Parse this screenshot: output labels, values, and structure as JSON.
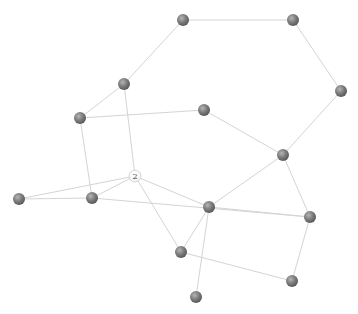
{
  "graph": {
    "node_radius": 6,
    "colors": {
      "edge": "#d4d4d4",
      "node_dark_light": "#b5b5b5",
      "node_dark_mid": "#7d7d7d",
      "node_dark_shadow": "#5a5a5a",
      "node_light_fill": "#ffffff",
      "node_light_stroke": "#bdbdbd"
    },
    "nodes": [
      {
        "id": "A",
        "label": "",
        "x": 183,
        "y": 20,
        "style": "dark"
      },
      {
        "id": "B",
        "label": "",
        "x": 293,
        "y": 20,
        "style": "dark"
      },
      {
        "id": "C",
        "label": "",
        "x": 341,
        "y": 91,
        "style": "dark"
      },
      {
        "id": "D",
        "label": "",
        "x": 283,
        "y": 155,
        "style": "dark"
      },
      {
        "id": "E",
        "label": "",
        "x": 124,
        "y": 84,
        "style": "dark"
      },
      {
        "id": "F",
        "label": "",
        "x": 80,
        "y": 118,
        "style": "dark"
      },
      {
        "id": "G",
        "label": "",
        "x": 204,
        "y": 110,
        "style": "dark"
      },
      {
        "id": "N2",
        "label": "2",
        "x": 135,
        "y": 176,
        "style": "light"
      },
      {
        "id": "K",
        "label": "",
        "x": 19,
        "y": 199,
        "style": "dark"
      },
      {
        "id": "H",
        "label": "",
        "x": 92,
        "y": 198,
        "style": "dark"
      },
      {
        "id": "I",
        "label": "",
        "x": 209,
        "y": 207,
        "style": "dark"
      },
      {
        "id": "J",
        "label": "",
        "x": 310,
        "y": 217,
        "style": "dark"
      },
      {
        "id": "L",
        "label": "",
        "x": 181,
        "y": 252,
        "style": "dark"
      },
      {
        "id": "N",
        "label": "",
        "x": 292,
        "y": 281,
        "style": "dark"
      },
      {
        "id": "M",
        "label": "",
        "x": 196,
        "y": 297,
        "style": "dark"
      }
    ],
    "edges": [
      [
        "A",
        "B"
      ],
      [
        "B",
        "C"
      ],
      [
        "C",
        "D"
      ],
      [
        "E",
        "A"
      ],
      [
        "E",
        "F"
      ],
      [
        "E",
        "N2"
      ],
      [
        "F",
        "G"
      ],
      [
        "F",
        "H"
      ],
      [
        "G",
        "D"
      ],
      [
        "D",
        "I"
      ],
      [
        "D",
        "J"
      ],
      [
        "N2",
        "K"
      ],
      [
        "N2",
        "H"
      ],
      [
        "N2",
        "I"
      ],
      [
        "N2",
        "L"
      ],
      [
        "K",
        "H"
      ],
      [
        "H",
        "J"
      ],
      [
        "I",
        "J"
      ],
      [
        "I",
        "L"
      ],
      [
        "I",
        "M"
      ],
      [
        "J",
        "N"
      ],
      [
        "L",
        "N"
      ]
    ]
  },
  "footer": {
    "text": ""
  }
}
